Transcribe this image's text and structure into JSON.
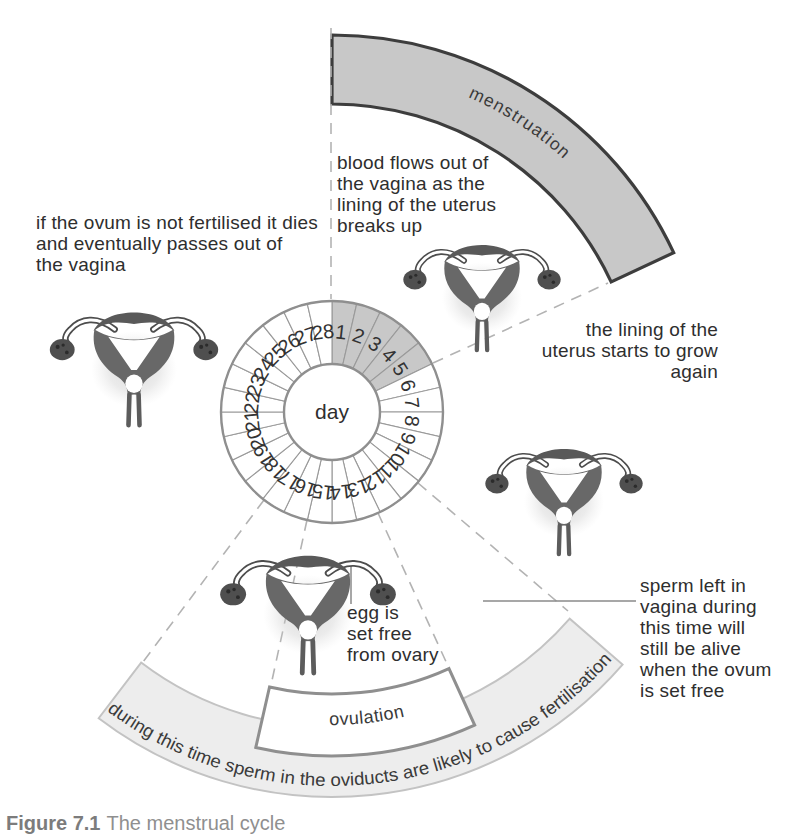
{
  "figure": {
    "caption_prefix": "Figure 7.1",
    "caption_title": "The menstrual cycle"
  },
  "wheel": {
    "center_label": "day",
    "days": [
      1,
      2,
      3,
      4,
      5,
      6,
      7,
      8,
      9,
      10,
      11,
      12,
      13,
      14,
      15,
      16,
      17,
      18,
      19,
      20,
      21,
      22,
      23,
      24,
      25,
      26,
      27,
      28
    ],
    "shaded_days": [
      1,
      2,
      3,
      4,
      5
    ]
  },
  "bands": {
    "menstruation": {
      "label": "menstruation"
    },
    "fertile_window": {
      "label": "during this time sperm in the oviducts are likely to cause fertilisation"
    },
    "ovulation": {
      "label": "ovulation"
    }
  },
  "annotations": {
    "blood": {
      "lines": [
        "blood flows out of",
        "the vagina as the",
        "lining of the uterus",
        "breaks up"
      ]
    },
    "ovum": {
      "lines": [
        "if the ovum is not fertilised it dies",
        "and eventually passes out of",
        "the vagina"
      ]
    },
    "lining": {
      "lines": [
        "the lining of the",
        "uterus starts to grow",
        "again"
      ]
    },
    "sperm": {
      "lines": [
        "sperm left in",
        "vagina during",
        "this time will",
        "still be alive",
        "when the ovum",
        "is set free"
      ]
    },
    "egg": {
      "lines": [
        "egg is",
        "set free",
        "from ovary"
      ]
    }
  },
  "colors": {
    "band_gray": "#c8c8c8",
    "band_dark_stroke": "#3d3d3d",
    "light_band": "#ededed",
    "outline_gray": "#8f8f8f",
    "dash_gray": "#b3b3b3",
    "text": "#2e2e2e"
  },
  "geometry": {
    "canvas": {
      "w": 799,
      "h": 826
    },
    "wheel": {
      "cx": 332,
      "cy": 412,
      "outer_r": 111,
      "inner_r": 48,
      "number_r": 80.5,
      "segments": 28
    },
    "menstruation_band": {
      "inner_r": 308,
      "outer_r": 377,
      "start_deg": 0,
      "end_deg": 65,
      "text_r": 343,
      "text_start_deg": 5,
      "text_end_deg": 61
    },
    "fertile_band": {
      "inner_r": 315,
      "outer_r": 385,
      "start_deg": 131,
      "end_deg": 217.3,
      "text_r": 374,
      "text_start_deg": 217,
      "text_end_deg": 130.5,
      "text_length": 558
    },
    "ovulation_band": {
      "inner_r": 282,
      "outer_r": 344,
      "start_deg": 155.5,
      "end_deg": 192.8,
      "text_r": 313,
      "text_start_deg": 190,
      "text_end_deg": 157
    },
    "dashed_lines": [
      [
        331,
        28,
        331,
        299
      ],
      [
        433,
        363,
        608,
        283
      ],
      [
        418,
        483,
        568,
        611
      ],
      [
        378,
        513,
        448,
        666
      ],
      [
        307,
        520,
        271,
        685
      ],
      [
        264,
        500,
        143,
        662
      ]
    ],
    "solid_lines": [
      [
        483,
        601,
        636,
        601
      ],
      [
        351,
        562,
        351,
        604
      ]
    ],
    "uterus_placements": [
      {
        "name": "uterus-illustration-left",
        "tx": 42,
        "ty": 288,
        "s": 0.92
      },
      {
        "name": "uterus-illustration-top",
        "tx": 396,
        "ty": 222,
        "s": 0.86
      },
      {
        "name": "uterus-illustration-right",
        "tx": 478,
        "ty": 426,
        "s": 0.86
      },
      {
        "name": "uterus-illustration-bottom",
        "tx": 212,
        "ty": 530,
        "s": 0.96
      }
    ]
  }
}
